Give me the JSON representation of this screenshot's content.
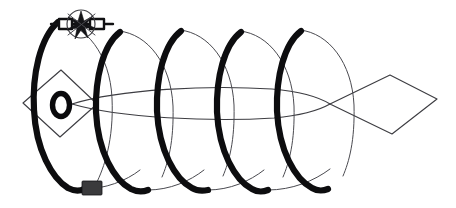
{
  "figure": {
    "title": "Helical coil wrapped around a fish-shaped body",
    "caption": "",
    "background_color": "#ffffff",
    "width": 456,
    "height": 208
  },
  "colors": {
    "ink_thick": "#0d0d0f",
    "ink_thin": "#3d3d42",
    "ink_soft": "#4a4a50",
    "weight_fill": "#3a3a3c",
    "burst_fill": "#141417",
    "paper": "#ffffff"
  },
  "parts": {
    "helix": {
      "label": "helix-coil",
      "turn_count": 4,
      "turn_centers_x": [
        55,
        100,
        155,
        216,
        276,
        330
      ],
      "near_side_note": "thick stroke",
      "far_side_note": "thin stroke"
    },
    "body": {
      "label": "fish-body-outline",
      "nose_x": 72,
      "tail_join_x": 330,
      "center_y": 104
    },
    "head": {
      "label": "diamond-head",
      "points": "24,104 60,72 96,104 60,136"
    },
    "eye": {
      "label": "eye-ring",
      "cx": 61,
      "cy": 105,
      "rx": 8,
      "ry": 11
    },
    "tail": {
      "label": "kite-tail",
      "points": "330,104 390,76 436,99 393,133"
    },
    "swivel": {
      "label": "swivel-hub",
      "cx": 80,
      "cy": 24,
      "r": 14,
      "bar_left_x": 51,
      "bar_right_x": 113,
      "bar_y": 24
    },
    "weight": {
      "label": "sinker-block",
      "x": 82,
      "y": 181,
      "width": 20,
      "height": 14
    }
  },
  "annotations": {
    "swivel_name": "swivel-hub",
    "weight_name": "sinker-block",
    "eye_name": "eye-ring",
    "coil_name": "helix-coil",
    "head_name": "diamond-head",
    "tail_name": "kite-tail"
  }
}
